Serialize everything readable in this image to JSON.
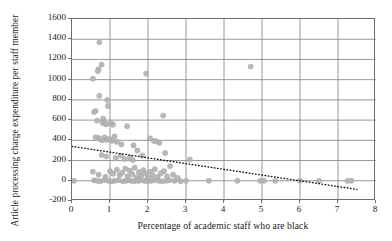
{
  "chart_data": {
    "type": "scatter",
    "title": "",
    "xlabel": "Percentage of academic staff who are black",
    "ylabel": "Article processing charge expenditure per staff member",
    "xlim": [
      0,
      8
    ],
    "ylim": [
      -200,
      1600
    ],
    "xticks": [
      0,
      1,
      2,
      3,
      4,
      5,
      6,
      7,
      8
    ],
    "yticks": [
      -200,
      0,
      200,
      400,
      600,
      800,
      1000,
      1200,
      1400,
      1600
    ],
    "grid": true,
    "legend": "none",
    "marker_color": "#b3b3b3",
    "marker_edge_color": "#a6a6a6",
    "axis_color": "#6e6e6e",
    "grid_color": "#8c8c8c",
    "trendline_color": "#111111",
    "trendline_style": "dotted",
    "points": [
      [
        0.72,
        1370
      ],
      [
        0.78,
        1150
      ],
      [
        0.7,
        1105
      ],
      [
        0.68,
        1085
      ],
      [
        0.55,
        1010
      ],
      [
        1.95,
        1060
      ],
      [
        4.7,
        1130
      ],
      [
        0.72,
        840
      ],
      [
        0.93,
        800
      ],
      [
        0.95,
        740
      ],
      [
        0.62,
        690
      ],
      [
        0.82,
        615
      ],
      [
        0.58,
        680
      ],
      [
        0.66,
        595
      ],
      [
        0.8,
        575
      ],
      [
        0.86,
        565
      ],
      [
        0.9,
        560
      ],
      [
        1.02,
        570
      ],
      [
        1.08,
        555
      ],
      [
        1.45,
        540
      ],
      [
        2.4,
        645
      ],
      [
        0.62,
        430
      ],
      [
        0.7,
        425
      ],
      [
        0.75,
        410
      ],
      [
        0.8,
        400
      ],
      [
        0.86,
        430
      ],
      [
        0.92,
        405
      ],
      [
        0.98,
        415
      ],
      [
        1.05,
        395
      ],
      [
        1.12,
        440
      ],
      [
        1.18,
        385
      ],
      [
        1.3,
        360
      ],
      [
        2.05,
        420
      ],
      [
        2.15,
        395
      ],
      [
        2.22,
        390
      ],
      [
        2.3,
        375
      ],
      [
        1.62,
        350
      ],
      [
        1.72,
        300
      ],
      [
        0.78,
        255
      ],
      [
        0.9,
        240
      ],
      [
        1.15,
        225
      ],
      [
        1.28,
        250
      ],
      [
        1.38,
        215
      ],
      [
        1.52,
        230
      ],
      [
        1.6,
        205
      ],
      [
        1.85,
        250
      ],
      [
        2.45,
        275
      ],
      [
        3.1,
        210
      ],
      [
        0.55,
        90
      ],
      [
        0.7,
        60
      ],
      [
        0.88,
        40
      ],
      [
        1.0,
        95
      ],
      [
        1.08,
        70
      ],
      [
        1.18,
        110
      ],
      [
        1.25,
        55
      ],
      [
        1.32,
        80
      ],
      [
        1.4,
        120
      ],
      [
        1.46,
        45
      ],
      [
        1.52,
        100
      ],
      [
        1.58,
        65
      ],
      [
        1.65,
        130
      ],
      [
        1.7,
        35
      ],
      [
        1.76,
        85
      ],
      [
        1.82,
        50
      ],
      [
        1.88,
        105
      ],
      [
        1.94,
        70
      ],
      [
        2.0,
        30
      ],
      [
        2.06,
        90
      ],
      [
        2.12,
        55
      ],
      [
        2.18,
        115
      ],
      [
        2.26,
        40
      ],
      [
        2.34,
        75
      ],
      [
        2.42,
        95
      ],
      [
        2.5,
        45
      ],
      [
        2.58,
        145
      ],
      [
        2.66,
        60
      ],
      [
        2.78,
        30
      ],
      [
        0.58,
        5
      ],
      [
        0.66,
        0
      ],
      [
        0.74,
        -5
      ],
      [
        0.84,
        5
      ],
      [
        0.96,
        0
      ],
      [
        1.04,
        -5
      ],
      [
        1.12,
        0
      ],
      [
        1.22,
        5
      ],
      [
        1.34,
        -5
      ],
      [
        1.42,
        0
      ],
      [
        1.5,
        5
      ],
      [
        1.56,
        0
      ],
      [
        1.64,
        -5
      ],
      [
        1.74,
        0
      ],
      [
        1.8,
        5
      ],
      [
        1.9,
        0
      ],
      [
        1.98,
        -5
      ],
      [
        2.08,
        0
      ],
      [
        2.16,
        5
      ],
      [
        2.28,
        0
      ],
      [
        2.38,
        -5
      ],
      [
        2.48,
        0
      ],
      [
        2.56,
        5
      ],
      [
        2.7,
        0
      ],
      [
        2.86,
        -5
      ],
      [
        3.0,
        0
      ],
      [
        3.6,
        0
      ],
      [
        4.35,
        0
      ],
      [
        4.95,
        0
      ],
      [
        5.05,
        0
      ],
      [
        5.35,
        0
      ],
      [
        6.0,
        0
      ],
      [
        6.5,
        0
      ],
      [
        7.25,
        0
      ],
      [
        7.35,
        0
      ],
      [
        0.05,
        0
      ]
    ],
    "trendline": {
      "x0": 0.0,
      "y0": 340,
      "x1": 7.5,
      "y1": -85
    }
  }
}
